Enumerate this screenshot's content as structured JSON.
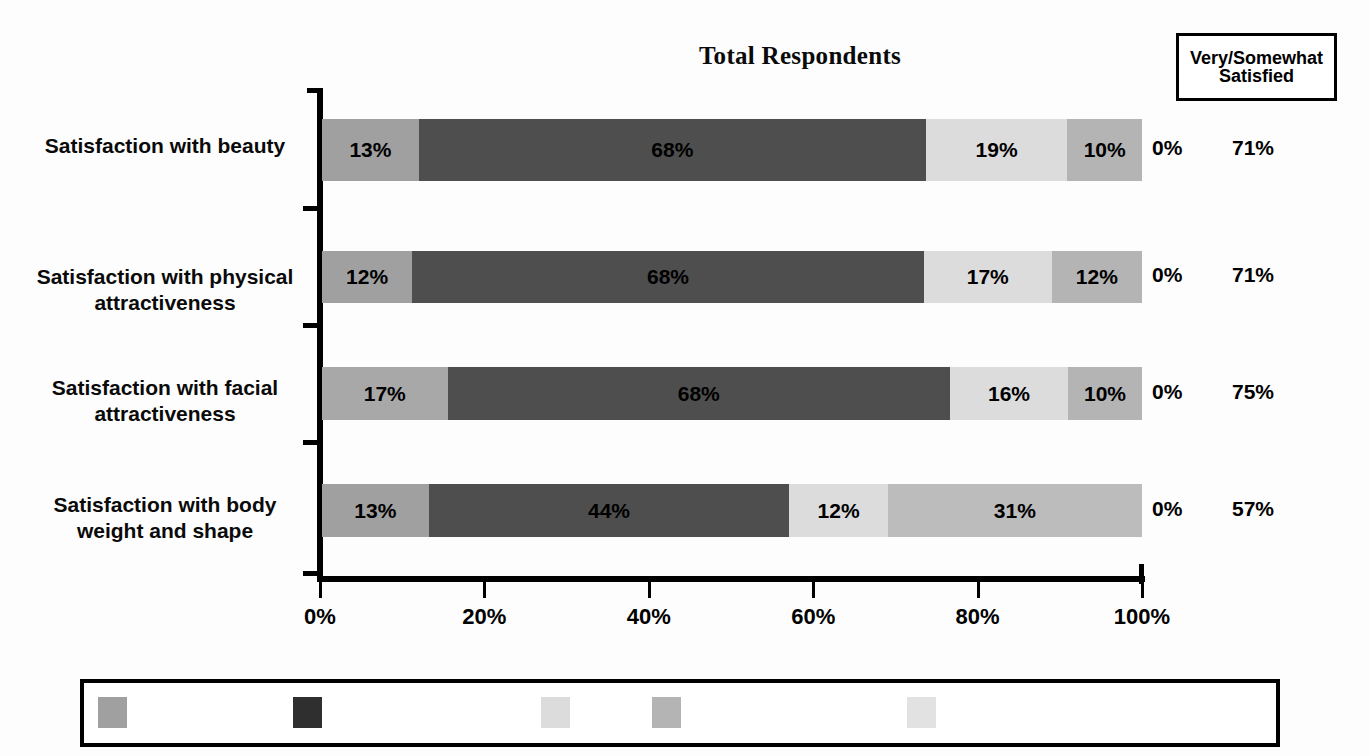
{
  "chart_data": {
    "type": "bar",
    "subtype": "stacked-horizontal-100",
    "title": "Total Respondents",
    "xlabel": "",
    "ylabel": "",
    "xlim": [
      0,
      100
    ],
    "xticks": [
      "0%",
      "20%",
      "40%",
      "60%",
      "80%",
      "100%"
    ],
    "xtick_values": [
      0,
      20,
      40,
      60,
      80,
      100
    ],
    "grid": false,
    "legend_position": "bottom",
    "categories": [
      "Satisfaction with beauty",
      "Satisfaction with physical attractiveness",
      "Satisfaction with facial attractiveness",
      "Satisfaction with body weight and shape"
    ],
    "series": [
      {
        "name": "series-1",
        "color": "#a0a0a0",
        "values": [
          13,
          12,
          17,
          13
        ]
      },
      {
        "name": "series-2",
        "color": "#4e4e4e",
        "values": [
          68,
          68,
          68,
          44
        ]
      },
      {
        "name": "series-3",
        "color": "#dcdcdc",
        "values": [
          19,
          17,
          16,
          12
        ]
      },
      {
        "name": "series-4",
        "color": "#b4b4b4",
        "values": [
          10,
          12,
          10,
          31
        ]
      },
      {
        "name": "series-5",
        "color": "#e4e4e4",
        "values": [
          0,
          0,
          0,
          0
        ]
      }
    ],
    "annotations": {
      "right_columns": [
        {
          "header": "",
          "values": [
            "0%",
            "0%",
            "0%",
            "0%"
          ]
        },
        {
          "header": "Very/Somewhat Satisfied",
          "values": [
            "71%",
            "71%",
            "75%",
            "57%"
          ]
        }
      ]
    }
  },
  "header": {
    "title": "Total Respondents",
    "satisfied_box_line1": "Very/Somewhat",
    "satisfied_box_line2": "Satisfied"
  },
  "axis": {
    "ticks": [
      {
        "label": "0%",
        "value": 0
      },
      {
        "label": "20%",
        "value": 20
      },
      {
        "label": "40%",
        "value": 40
      },
      {
        "label": "60%",
        "value": 60
      },
      {
        "label": "80%",
        "value": 80
      },
      {
        "label": "100%",
        "value": 100
      }
    ]
  },
  "rows": [
    {
      "label_line1": "Satisfaction with beauty",
      "label_line2": "",
      "segments": [
        {
          "label": "13%",
          "value": 13,
          "color": "#a0a0a0"
        },
        {
          "label": "68%",
          "value": 68,
          "color": "#4e4e4e"
        },
        {
          "label": "19%",
          "value": 19,
          "color": "#dcdcdc"
        },
        {
          "label": "10%",
          "value": 10,
          "color": "#b4b4b4"
        }
      ],
      "zero_value": "0%",
      "satisfied_value": "71%"
    },
    {
      "label_line1": "Satisfaction with physical",
      "label_line2": "attractiveness",
      "segments": [
        {
          "label": "12%",
          "value": 12,
          "color": "#a0a0a0"
        },
        {
          "label": "68%",
          "value": 68,
          "color": "#4e4e4e"
        },
        {
          "label": "17%",
          "value": 17,
          "color": "#dcdcdc"
        },
        {
          "label": "12%",
          "value": 12,
          "color": "#b4b4b4"
        }
      ],
      "zero_value": "0%",
      "satisfied_value": "71%"
    },
    {
      "label_line1": "Satisfaction with facial",
      "label_line2": "attractiveness",
      "segments": [
        {
          "label": "17%",
          "value": 17,
          "color": "#a8a8a8"
        },
        {
          "label": "68%",
          "value": 68,
          "color": "#4e4e4e"
        },
        {
          "label": "16%",
          "value": 16,
          "color": "#dcdcdc"
        },
        {
          "label": "10%",
          "value": 10,
          "color": "#b4b4b4"
        }
      ],
      "zero_value": "0%",
      "satisfied_value": "75%"
    },
    {
      "label_line1": "Satisfaction with body",
      "label_line2": "weight and shape",
      "segments": [
        {
          "label": "13%",
          "value": 13,
          "color": "#a0a0a0"
        },
        {
          "label": "44%",
          "value": 44,
          "color": "#4e4e4e"
        },
        {
          "label": "12%",
          "value": 12,
          "color": "#dcdcdc"
        },
        {
          "label": "31%",
          "value": 31,
          "color": "#bcbcbc"
        }
      ],
      "zero_value": "0%",
      "satisfied_value": "57%"
    }
  ],
  "legend": {
    "items": [
      {
        "label": "",
        "color": "#a0a0a0",
        "x": 94
      },
      {
        "label": "",
        "color": "#2f2f2f",
        "x": 289
      },
      {
        "label": "",
        "color": "#dcdcdc",
        "x": 537
      },
      {
        "label": "",
        "color": "#b4b4b4",
        "x": 648
      },
      {
        "label": "",
        "color": "#e2e2e2",
        "x": 903
      }
    ]
  },
  "colors": {
    "series1": "#a0a0a0",
    "series2": "#4e4e4e",
    "series3": "#dcdcdc",
    "series4": "#b4b4b4",
    "series5": "#e4e4e4",
    "axis": "#000000",
    "background": "#ffffff"
  }
}
